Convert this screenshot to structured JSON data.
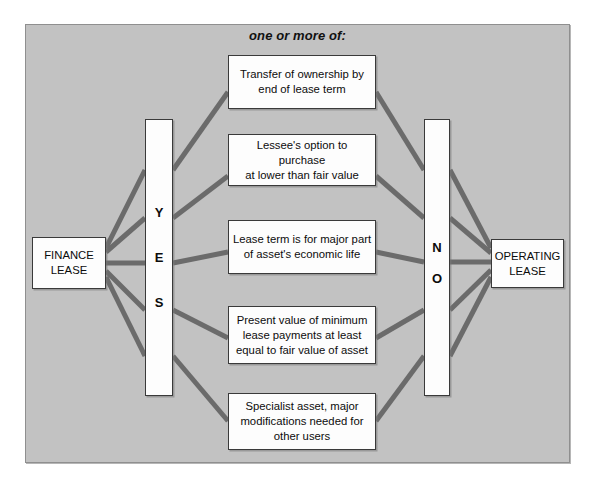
{
  "diagram": {
    "title": "one or more of:",
    "background_color": "#c2c2c2",
    "connector_color": "#6b6b6b",
    "node_fill": "#fdfdfd",
    "node_border": "#3a3a3a",
    "left_node": {
      "id": "finance-lease",
      "label": "FINANCE\nLEASE"
    },
    "right_node": {
      "id": "operating-lease",
      "label": "OPERATING\nLEASE"
    },
    "yes_bar": {
      "id": "yes",
      "letters": [
        "Y",
        "E",
        "S"
      ]
    },
    "no_bar": {
      "id": "no",
      "letters": [
        "N",
        "O"
      ]
    },
    "criteria": [
      {
        "id": "transfer-of-ownership",
        "label": "Transfer of ownership by\nend of lease term"
      },
      {
        "id": "option-to-purchase",
        "label": "Lessee's option to purchase\nat lower than fair value"
      },
      {
        "id": "lease-term-major-part",
        "label": "Lease term is for major part\nof asset's economic life"
      },
      {
        "id": "present-value-minimum",
        "label": "Present value of minimum\nlease payments at least\nequal to fair value of asset"
      },
      {
        "id": "specialist-asset",
        "label": "Specialist asset, major\nmodifications needed for\nother users"
      }
    ]
  }
}
